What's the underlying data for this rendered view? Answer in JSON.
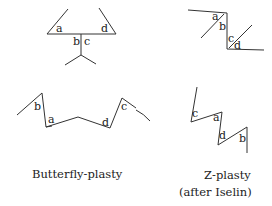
{
  "figures": {
    "butterfly_top": {
      "labels": [
        "a",
        "b",
        "c",
        "d"
      ]
    },
    "z_top": {
      "labels": [
        "a",
        "b",
        "c",
        "d"
      ]
    },
    "butterfly_bottom": {
      "labels": [
        "b",
        "a",
        "d",
        "c"
      ]
    },
    "z_bottom": {
      "labels": [
        "c",
        "a",
        "d",
        "b"
      ]
    }
  },
  "captions": {
    "butterfly": "Butterfly-plasty",
    "z_line1": "Z-plasty",
    "z_line2": "(after Iselin)"
  },
  "colors": {
    "line": "#333333",
    "text": "#222222",
    "background": "#ffffff"
  }
}
